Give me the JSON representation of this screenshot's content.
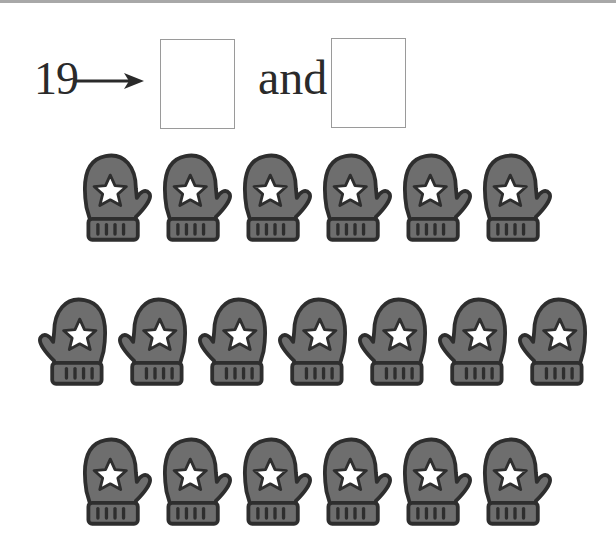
{
  "question": {
    "number": "19",
    "connector": "and",
    "answer_boxes": [
      {
        "value": ""
      },
      {
        "value": ""
      }
    ]
  },
  "icon": "mitten-with-star-icon",
  "colors": {
    "mitten_fill": "#6e6e6e",
    "mitten_outline": "#2e2e2e",
    "star_fill": "#ffffff",
    "box_border": "#9a9a9a",
    "text": "#2a2a2a"
  },
  "groups": [
    {
      "count": 6,
      "orientation": "thumb-right",
      "centers_x": [
        115,
        195,
        275,
        355,
        435,
        515
      ],
      "top": 148
    },
    {
      "count": 7,
      "orientation": "thumb-left",
      "centers_x": [
        75,
        155,
        235,
        315,
        395,
        475,
        555
      ],
      "top": 292
    },
    {
      "count": 6,
      "orientation": "thumb-right",
      "centers_x": [
        115,
        195,
        275,
        355,
        435,
        515
      ],
      "top": 432
    }
  ],
  "total_mittens": 19
}
